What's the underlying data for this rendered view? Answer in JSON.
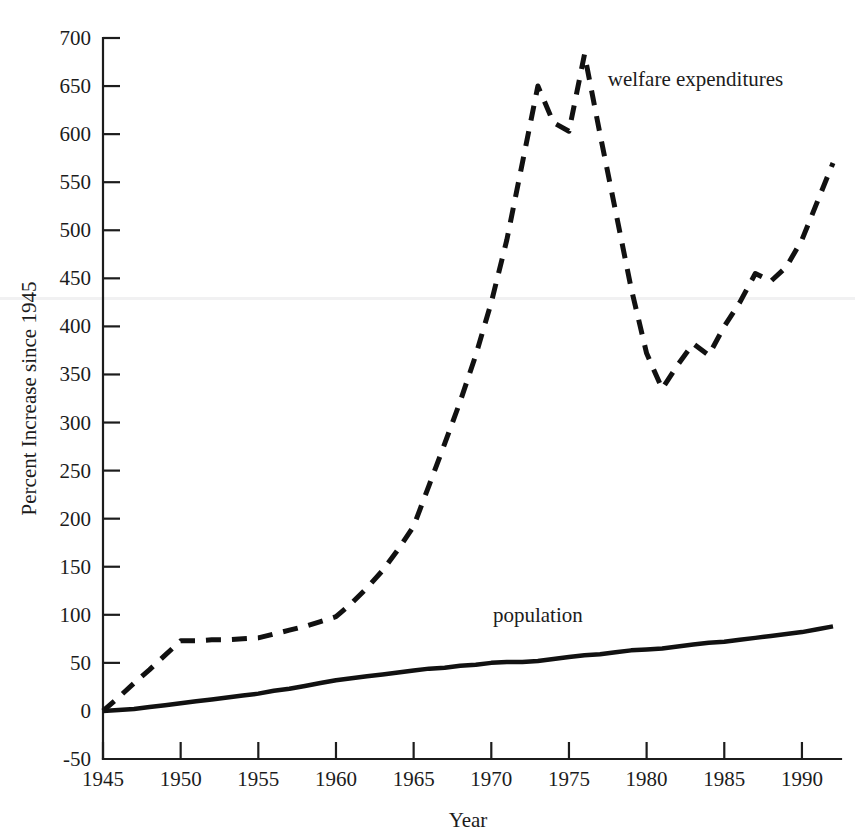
{
  "chart_data": {
    "type": "line",
    "title": "",
    "xlabel": "Year",
    "ylabel": "Percent Increase since 1945",
    "xlim": [
      1945,
      1992
    ],
    "ylim": [
      -50,
      700
    ],
    "grid": false,
    "legend_position": "inline-annotation",
    "x_ticks": [
      1945,
      1950,
      1955,
      1960,
      1965,
      1970,
      1975,
      1980,
      1985,
      1990
    ],
    "x_tick_labels": [
      "1945",
      "1950",
      "1955",
      "1960",
      "1965",
      "1970",
      "1975",
      "1980",
      "1985",
      "1990"
    ],
    "y_ticks": [
      -50,
      0,
      50,
      100,
      150,
      200,
      250,
      300,
      350,
      400,
      450,
      500,
      550,
      600,
      650,
      700
    ],
    "y_tick_labels": [
      "-50",
      "0",
      "50",
      "100",
      "150",
      "200",
      "250",
      "300",
      "350",
      "400",
      "450",
      "500",
      "550",
      "600",
      "650",
      "700"
    ],
    "series": [
      {
        "name": "welfare expenditures",
        "style": "dashed",
        "color": "#111111",
        "label_x": 1977.5,
        "label_y": 650,
        "x": [
          1945,
          1946,
          1947,
          1948,
          1949,
          1950,
          1951,
          1952,
          1953,
          1954,
          1955,
          1956,
          1957,
          1958,
          1959,
          1960,
          1961,
          1962,
          1963,
          1964,
          1965,
          1966,
          1967,
          1968,
          1969,
          1970,
          1971,
          1972,
          1973,
          1974,
          1975,
          1976,
          1977,
          1978,
          1979,
          1980,
          1981,
          1982,
          1983,
          1984,
          1985,
          1986,
          1987,
          1988,
          1989,
          1990,
          1991,
          1992
        ],
        "y": [
          0,
          14,
          29,
          43,
          58,
          73,
          73,
          74,
          74,
          75,
          76,
          80,
          84,
          88,
          93,
          98,
          112,
          128,
          146,
          168,
          192,
          235,
          278,
          322,
          370,
          425,
          490,
          570,
          650,
          612,
          603,
          683,
          600,
          520,
          440,
          372,
          335,
          360,
          382,
          370,
          400,
          425,
          455,
          447,
          462,
          490,
          530,
          570
        ]
      },
      {
        "name": "population",
        "style": "solid",
        "color": "#111111",
        "label_x": 1973.0,
        "label_y": 92,
        "x": [
          1945,
          1946,
          1947,
          1948,
          1949,
          1950,
          1951,
          1952,
          1953,
          1954,
          1955,
          1956,
          1957,
          1958,
          1959,
          1960,
          1961,
          1962,
          1963,
          1964,
          1965,
          1966,
          1967,
          1968,
          1969,
          1970,
          1971,
          1972,
          1973,
          1974,
          1975,
          1976,
          1977,
          1978,
          1979,
          1980,
          1981,
          1982,
          1983,
          1984,
          1985,
          1986,
          1987,
          1988,
          1989,
          1990,
          1991,
          1992
        ],
        "y": [
          0,
          1,
          2,
          4,
          6,
          8,
          10,
          12,
          14,
          16,
          18,
          21,
          23,
          26,
          29,
          32,
          34,
          36,
          38,
          40,
          42,
          44,
          45,
          47,
          48,
          50,
          51,
          51,
          52,
          54,
          56,
          58,
          59,
          61,
          63,
          64,
          65,
          67,
          69,
          71,
          72,
          74,
          76,
          78,
          80,
          82,
          85,
          88
        ]
      }
    ]
  },
  "annotations": {
    "welfare_label": "welfare expenditures",
    "population_label": "population"
  }
}
